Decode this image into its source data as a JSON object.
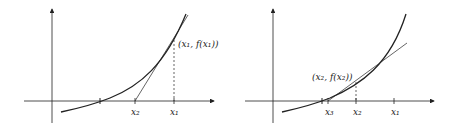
{
  "figures": [
    {
      "name": "newton-step-1",
      "point_label": "(x₁, f(x₁))",
      "x_labels": [
        "x₂",
        "x₁"
      ]
    },
    {
      "name": "newton-step-2",
      "point_label": "(x₂, f(x₂))",
      "x_labels": [
        "x₃",
        "x₂",
        "x₁"
      ]
    }
  ],
  "colors": {
    "stroke": "#222222",
    "background": "#ffffff"
  }
}
